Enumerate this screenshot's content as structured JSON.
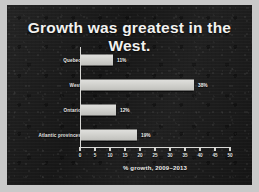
{
  "slide": {
    "title": "Growth was greatest in the West.",
    "background_color": "#1c1c1c",
    "title_color": "#f2f2f0",
    "frame_color": "#c9c9c9"
  },
  "chart_data": {
    "type": "bar",
    "orientation": "horizontal",
    "title": "Growth was greatest in the West.",
    "categories": [
      "Quebec",
      "West",
      "Ontario",
      "Atlantic provinces"
    ],
    "values": [
      11,
      38,
      12,
      19
    ],
    "value_labels": [
      "11%",
      "38%",
      "12%",
      "19%"
    ],
    "xlabel": "% growth, 2009–2013",
    "ylabel": "",
    "xlim": [
      0,
      50
    ],
    "xticks": [
      0,
      5,
      10,
      15,
      20,
      25,
      30,
      35,
      40,
      45,
      50
    ],
    "xtick_labels": [
      "0",
      "5",
      "10",
      "15",
      "20",
      "25",
      "30",
      "35",
      "40",
      "45",
      "50"
    ],
    "grid": false,
    "legend": false,
    "bar_color": "#cfcfcb",
    "axis_color": "#d8d8d5",
    "text_color": "#e6e6e4"
  }
}
